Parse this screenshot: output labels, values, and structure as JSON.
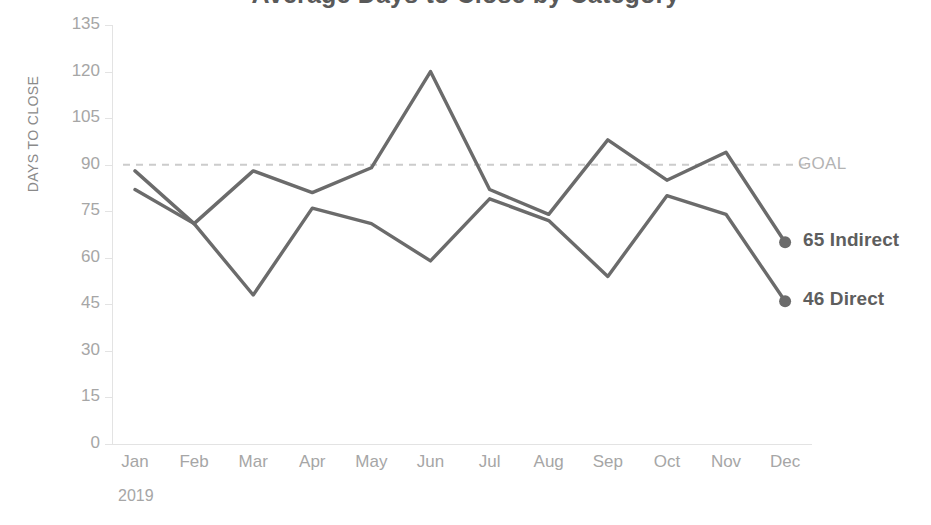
{
  "chart_data": {
    "type": "line",
    "title": "Average Days to Close by Category",
    "xlabel": "2019",
    "ylabel": "DAYS TO CLOSE",
    "categories": [
      "Jan",
      "Feb",
      "Mar",
      "Apr",
      "May",
      "Jun",
      "Jul",
      "Aug",
      "Sep",
      "Oct",
      "Nov",
      "Dec"
    ],
    "ylim": [
      0,
      135
    ],
    "yticks": [
      0,
      15,
      30,
      45,
      60,
      75,
      90,
      105,
      120,
      135
    ],
    "ytick_labels": [
      "0",
      "15",
      "30",
      "45",
      "60",
      "75",
      "90",
      "105",
      "120",
      "135"
    ],
    "grid": false,
    "legend_position": "right-endpoint-labels",
    "series": [
      {
        "name": "Indirect",
        "color": "#6b6b6b",
        "end_label": "65 Indirect",
        "end_value": 65,
        "values": [
          88,
          71,
          88,
          81,
          89,
          120,
          82,
          74,
          98,
          85,
          94,
          65
        ]
      },
      {
        "name": "Direct",
        "color": "#6b6b6b",
        "end_label": "46 Direct",
        "end_value": 46,
        "values": [
          82,
          71,
          48,
          76,
          71,
          59,
          79,
          72,
          54,
          80,
          74,
          46
        ]
      }
    ],
    "reference_line": {
      "label": "GOAL",
      "value": 90,
      "style": "dashed",
      "color": "#cccccc"
    },
    "annotations": [
      {
        "text": "GOAL",
        "value": 90
      },
      {
        "text": "65 Indirect",
        "value": 65
      },
      {
        "text": "46 Direct",
        "value": 46
      }
    ]
  },
  "axis": {
    "line_color": "#e3e3e3",
    "tick_color": "#a6a6a6"
  }
}
